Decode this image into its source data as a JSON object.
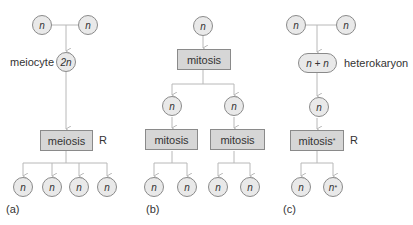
{
  "panels": [
    {
      "id": "a",
      "caption": "(a)",
      "top_nodes": [
        "n",
        "n"
      ],
      "meiocyte": {
        "label": "meiocyte",
        "value": "2n"
      },
      "process": {
        "label": "meiosis",
        "mark": "R"
      },
      "products": [
        "n",
        "n",
        "n",
        "n"
      ]
    },
    {
      "id": "b",
      "caption": "(b)",
      "top_node": "n",
      "process": {
        "label": "mitosis"
      },
      "middle_nodes": [
        "n",
        "n"
      ],
      "sub_processes": [
        {
          "label": "mitosis"
        },
        {
          "label": "mitosis"
        }
      ],
      "products": [
        "n",
        "n",
        "n",
        "n"
      ]
    },
    {
      "id": "c",
      "caption": "(c)",
      "top_nodes": [
        "n",
        "n"
      ],
      "heterokaryon": {
        "value": "n + n",
        "label": "heterokaryon"
      },
      "middle_node": "n",
      "process": {
        "label": "mitosis",
        "superscript": "*",
        "mark": "R"
      },
      "products": [
        "n",
        "n"
      ],
      "product_superscripts": [
        "",
        "*"
      ]
    }
  ],
  "colors": {
    "line": "#b8b8b8",
    "node_fill": "#e9e9e9",
    "box_fill": "#d6d6d6",
    "border": "#8a8a8a",
    "text": "#333333"
  }
}
